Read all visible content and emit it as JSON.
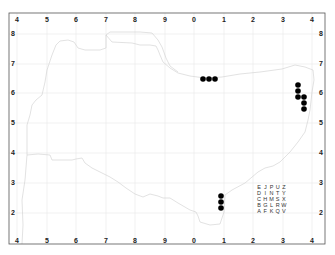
{
  "map": {
    "frame": {
      "left": 9,
      "top": 13,
      "right": 325,
      "bottom": 244
    },
    "x_tick_labels": [
      "4",
      "5",
      "6",
      "7",
      "8",
      "9",
      "0",
      "1",
      "2",
      "3",
      "4"
    ],
    "y_tick_labels": [
      "8",
      "7",
      "6",
      "5",
      "4",
      "3",
      "2"
    ],
    "grid_color": "#e8e8e8",
    "coast_color": "#c8c8c8",
    "dot_color": "#000000",
    "records": [
      {
        "x": 203,
        "y": 79
      },
      {
        "x": 209,
        "y": 79
      },
      {
        "x": 215,
        "y": 79
      },
      {
        "x": 298,
        "y": 85
      },
      {
        "x": 298,
        "y": 91
      },
      {
        "x": 298,
        "y": 97
      },
      {
        "x": 304,
        "y": 97
      },
      {
        "x": 304,
        "y": 103
      },
      {
        "x": 304,
        "y": 109
      },
      {
        "x": 221,
        "y": 196
      },
      {
        "x": 221,
        "y": 202
      },
      {
        "x": 221,
        "y": 208
      }
    ],
    "tetrad_key": [
      [
        "E",
        "J",
        "P",
        "U",
        "Z"
      ],
      [
        "D",
        "I",
        "N",
        "T",
        "Y"
      ],
      [
        "C",
        "H",
        "M",
        "S",
        "X"
      ],
      [
        "B",
        "G",
        "L",
        "R",
        "W"
      ],
      [
        "A",
        "F",
        "K",
        "Q",
        "V"
      ]
    ]
  }
}
